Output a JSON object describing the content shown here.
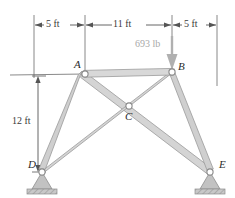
{
  "figure": {
    "colors": {
      "member_fill": "#d3d3d3",
      "member_edge": "#9a9a9a",
      "joint_fill": "#ffffff",
      "joint_edge": "#8a8a8a",
      "dimension_line": "#555555",
      "load_arrow": "#b0b0b0",
      "support_fill": "#bdbdbd",
      "ground_fill": "#b5b5b5",
      "label_text": "#2b2b2b"
    }
  },
  "joints": [
    {
      "id": "A",
      "label": "A",
      "x": 85,
      "y": 74
    },
    {
      "id": "B",
      "label": "B",
      "x": 172,
      "y": 72
    },
    {
      "id": "C",
      "label": "C",
      "x": 129,
      "y": 106
    },
    {
      "id": "D",
      "label": "D",
      "x": 42,
      "y": 172
    },
    {
      "id": "E",
      "label": "E",
      "x": 210,
      "y": 172
    }
  ],
  "members": [
    {
      "name": "member-AB",
      "from": "A",
      "to": "B"
    },
    {
      "name": "member-AD",
      "from": "A",
      "to": "D"
    },
    {
      "name": "member-AE",
      "from": "A",
      "to": "E"
    },
    {
      "name": "member-BD",
      "from": "B",
      "to": "D"
    },
    {
      "name": "member-BE",
      "from": "B",
      "to": "E"
    }
  ],
  "supports": [
    {
      "name": "support-D",
      "joint": "D",
      "type": "pin"
    },
    {
      "name": "support-E",
      "joint": "E",
      "type": "pin"
    }
  ],
  "load": {
    "label": "693 lb",
    "magnitude": 693,
    "unit": "lb",
    "applied_at": "B",
    "direction": "down"
  },
  "dimensions": {
    "horizontal": [
      {
        "label": "5 ft",
        "value": 5,
        "unit": "ft",
        "from_x": 34,
        "to_x": 85
      },
      {
        "label": "11 ft",
        "value": 11,
        "unit": "ft",
        "from_x": 85,
        "to_x": 172
      },
      {
        "label": "5 ft",
        "value": 5,
        "unit": "ft",
        "from_x": 172,
        "to_x": 217
      }
    ],
    "vertical": [
      {
        "label": "12 ft",
        "value": 12,
        "unit": "ft",
        "from_y": 76,
        "to_y": 172
      }
    ]
  }
}
